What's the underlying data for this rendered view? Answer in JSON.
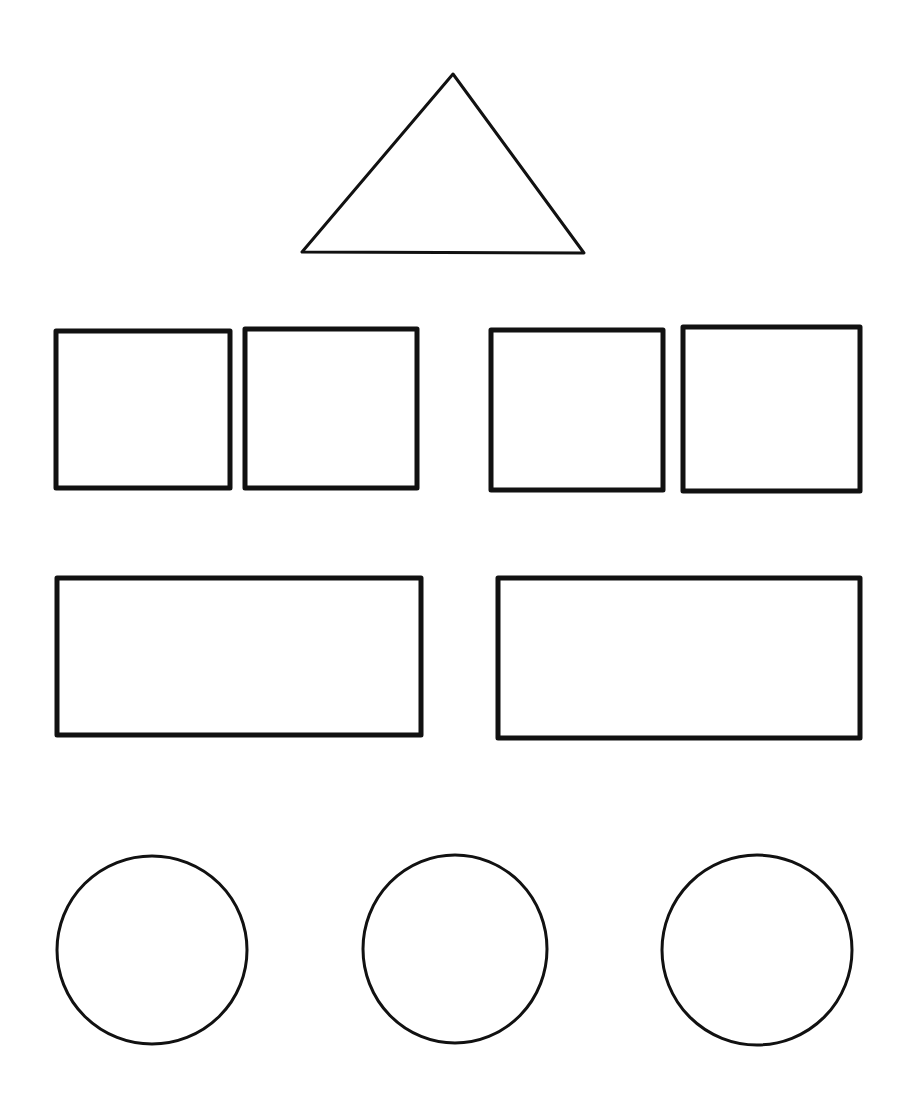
{
  "sketch": {
    "background": "#ffffff",
    "ink": "#111111",
    "triangle": {
      "points": [
        [
          453,
          74
        ],
        [
          302,
          252
        ],
        [
          584,
          253
        ]
      ]
    },
    "squares": [
      {
        "x": 56,
        "y": 331,
        "w": 174,
        "h": 157
      },
      {
        "x": 245,
        "y": 329,
        "w": 172,
        "h": 159
      },
      {
        "x": 491,
        "y": 330,
        "w": 172,
        "h": 160
      },
      {
        "x": 683,
        "y": 327,
        "w": 177,
        "h": 164
      }
    ],
    "rectangles": [
      {
        "x": 57,
        "y": 578,
        "w": 364,
        "h": 157
      },
      {
        "x": 498,
        "y": 578,
        "w": 362,
        "h": 160
      }
    ],
    "circles": [
      {
        "cx": 152,
        "cy": 950,
        "rx": 95,
        "ry": 94
      },
      {
        "cx": 455,
        "cy": 949,
        "rx": 92,
        "ry": 94
      },
      {
        "cx": 757,
        "cy": 950,
        "rx": 95,
        "ry": 95
      }
    ]
  }
}
